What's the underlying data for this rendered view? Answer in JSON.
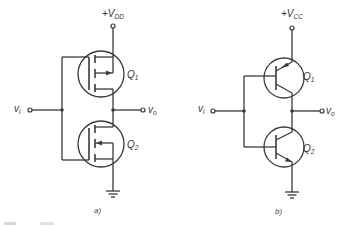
{
  "figure": {
    "circuit_a": {
      "supply_label": "+V",
      "supply_sub": "DD",
      "input_label": "v",
      "input_sub": "i",
      "output_label": "v",
      "output_sub": "o",
      "upper_transistor": {
        "label": "Q",
        "sub": "1",
        "type": "p-channel enhancement MOSFET"
      },
      "lower_transistor": {
        "label": "Q",
        "sub": "2",
        "type": "n-channel enhancement MOSFET"
      },
      "caption": "a)"
    },
    "circuit_b": {
      "supply_label": "+V",
      "supply_sub": "CC",
      "input_label": "v",
      "input_sub": "i",
      "output_label": "v",
      "output_sub": "o",
      "upper_transistor": {
        "label": "Q",
        "sub": "1",
        "type": "PNP BJT"
      },
      "lower_transistor": {
        "label": "Q",
        "sub": "2",
        "type": "NPN BJT"
      },
      "caption": "b)"
    }
  },
  "colors": {
    "line": "#3a3a3a",
    "background": "#ffffff"
  }
}
